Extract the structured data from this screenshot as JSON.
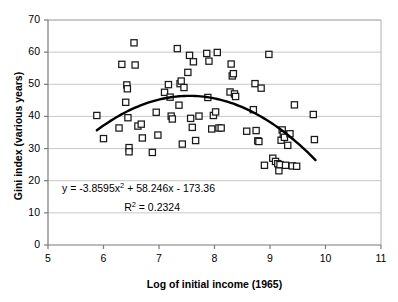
{
  "chart_data": {
    "type": "scatter",
    "title": "",
    "xlabel": "Log of initial income (1965)",
    "ylabel": "Gini index (various years)",
    "xlim": [
      5,
      11
    ],
    "ylim": [
      0,
      70
    ],
    "xticks": [
      5,
      6,
      7,
      8,
      9,
      10,
      11
    ],
    "yticks": [
      0,
      10,
      20,
      30,
      40,
      50,
      60,
      70
    ],
    "grid": "horizontal",
    "legend": "none",
    "marker": "open-square",
    "annotations": {
      "equation_prefix": "y = -3.8595x",
      "equation_exp1": "2",
      "equation_mid": " + 58.246x - 173.36",
      "r2_prefix": "R",
      "r2_exp": "2",
      "r2_value": " = 0.2324"
    },
    "trendline": {
      "type": "quadratic",
      "a": -3.8595,
      "b": 58.246,
      "c": -173.36,
      "x_start": 5.88,
      "x_end": 9.82
    },
    "points": [
      [
        5.88,
        40.3
      ],
      [
        6.0,
        33.1
      ],
      [
        6.28,
        36.4
      ],
      [
        6.33,
        56.2
      ],
      [
        6.4,
        44.4
      ],
      [
        6.42,
        49.8
      ],
      [
        6.43,
        48.6
      ],
      [
        6.44,
        39.6
      ],
      [
        6.46,
        30.3
      ],
      [
        6.46,
        29.0
      ],
      [
        6.55,
        62.9
      ],
      [
        6.57,
        56.0
      ],
      [
        6.62,
        37.0
      ],
      [
        6.68,
        37.6
      ],
      [
        6.7,
        33.3
      ],
      [
        6.88,
        28.8
      ],
      [
        6.95,
        41.3
      ],
      [
        6.98,
        34.2
      ],
      [
        7.1,
        47.5
      ],
      [
        7.17,
        49.9
      ],
      [
        7.2,
        46.0
      ],
      [
        7.22,
        40.1
      ],
      [
        7.24,
        39.2
      ],
      [
        7.33,
        61.1
      ],
      [
        7.36,
        43.5
      ],
      [
        7.38,
        50.2
      ],
      [
        7.4,
        51.0
      ],
      [
        7.42,
        31.4
      ],
      [
        7.45,
        49.0
      ],
      [
        7.52,
        53.7
      ],
      [
        7.55,
        59.0
      ],
      [
        7.57,
        39.4
      ],
      [
        7.6,
        36.6
      ],
      [
        7.62,
        57.0
      ],
      [
        7.66,
        32.5
      ],
      [
        7.72,
        40.1
      ],
      [
        7.86,
        59.6
      ],
      [
        7.88,
        45.9
      ],
      [
        7.9,
        57.2
      ],
      [
        7.95,
        36.1
      ],
      [
        7.98,
        40.3
      ],
      [
        8.02,
        41.4
      ],
      [
        8.05,
        59.9
      ],
      [
        8.08,
        36.4
      ],
      [
        8.12,
        36.4
      ],
      [
        8.28,
        47.6
      ],
      [
        8.3,
        56.3
      ],
      [
        8.32,
        52.6
      ],
      [
        8.34,
        53.3
      ],
      [
        8.36,
        47.0
      ],
      [
        8.38,
        46.2
      ],
      [
        8.58,
        35.4
      ],
      [
        8.7,
        42.1
      ],
      [
        8.73,
        50.2
      ],
      [
        8.75,
        35.6
      ],
      [
        8.78,
        32.4
      ],
      [
        8.8,
        32.2
      ],
      [
        8.84,
        48.8
      ],
      [
        8.9,
        24.8
      ],
      [
        8.98,
        59.3
      ],
      [
        9.05,
        27.0
      ],
      [
        9.1,
        26.0
      ],
      [
        9.14,
        25.3
      ],
      [
        9.16,
        23.1
      ],
      [
        9.18,
        25.0
      ],
      [
        9.2,
        32.6
      ],
      [
        9.22,
        35.8
      ],
      [
        9.24,
        34.4
      ],
      [
        9.26,
        33.5
      ],
      [
        9.28,
        24.8
      ],
      [
        9.32,
        31.0
      ],
      [
        9.36,
        34.6
      ],
      [
        9.4,
        24.6
      ],
      [
        9.44,
        43.6
      ],
      [
        9.48,
        24.5
      ],
      [
        9.78,
        40.6
      ],
      [
        9.8,
        32.8
      ]
    ]
  }
}
